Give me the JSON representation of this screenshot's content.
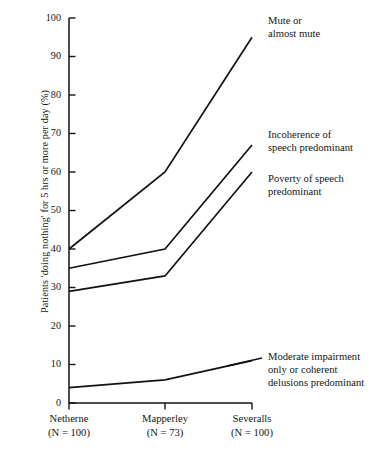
{
  "chart_data": {
    "type": "line",
    "title": "",
    "xlabel": "",
    "ylabel": "Patients 'doing nothing' for 5 hrs or more per day (%)",
    "categories": [
      "Netherne",
      "Mapperley",
      "Severalls"
    ],
    "category_sublabels": [
      "(N = 100)",
      "(N = 73)",
      "(N = 100)"
    ],
    "ylim": [
      0,
      100
    ],
    "yticks": [
      0,
      10,
      20,
      30,
      40,
      50,
      60,
      70,
      80,
      90,
      100
    ],
    "ytick_labels": [
      "0",
      "10",
      "20",
      "30",
      "40",
      "50",
      "60",
      "70",
      "80",
      "90",
      "100"
    ],
    "grid": false,
    "legend_position": "right-inline-annotations",
    "series": [
      {
        "name": "Mute or almost mute",
        "annotation": "Mute or\nalmost mute",
        "values": [
          40,
          60,
          95
        ]
      },
      {
        "name": "Incoherence of speech predominant",
        "annotation": "Incoherence of\nspeech predominant",
        "values": [
          35,
          40,
          67
        ]
      },
      {
        "name": "Poverty of speech predominant",
        "annotation": "Poverty of speech\npredominant",
        "values": [
          29,
          33,
          60
        ]
      },
      {
        "name": "Moderate impairment only or coherent delusions predominant",
        "annotation": "Moderate impairment\nonly or coherent\ndelusions predominant",
        "values": [
          4,
          6,
          11
        ]
      }
    ],
    "line_color": "#121212",
    "axis_color": "#121212",
    "background_color": "#ffffff"
  }
}
